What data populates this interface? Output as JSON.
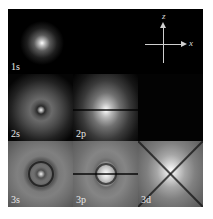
{
  "figure": {
    "cells": [
      {
        "id": "1s",
        "label": "1s"
      },
      {
        "id": "blank",
        "label": ""
      },
      {
        "id": "axes",
        "label": ""
      },
      {
        "id": "2s",
        "label": "2s"
      },
      {
        "id": "2p",
        "label": "2p"
      },
      {
        "id": "dark",
        "label": ""
      },
      {
        "id": "3s",
        "label": "3s"
      },
      {
        "id": "3p",
        "label": "3p"
      },
      {
        "id": "3d",
        "label": "3d"
      }
    ],
    "axes": {
      "vertical_label": "z",
      "horizontal_label": "x"
    },
    "colors": {
      "background": "#000000",
      "glow": "#ffffff",
      "label": "#e8e8e8"
    }
  }
}
